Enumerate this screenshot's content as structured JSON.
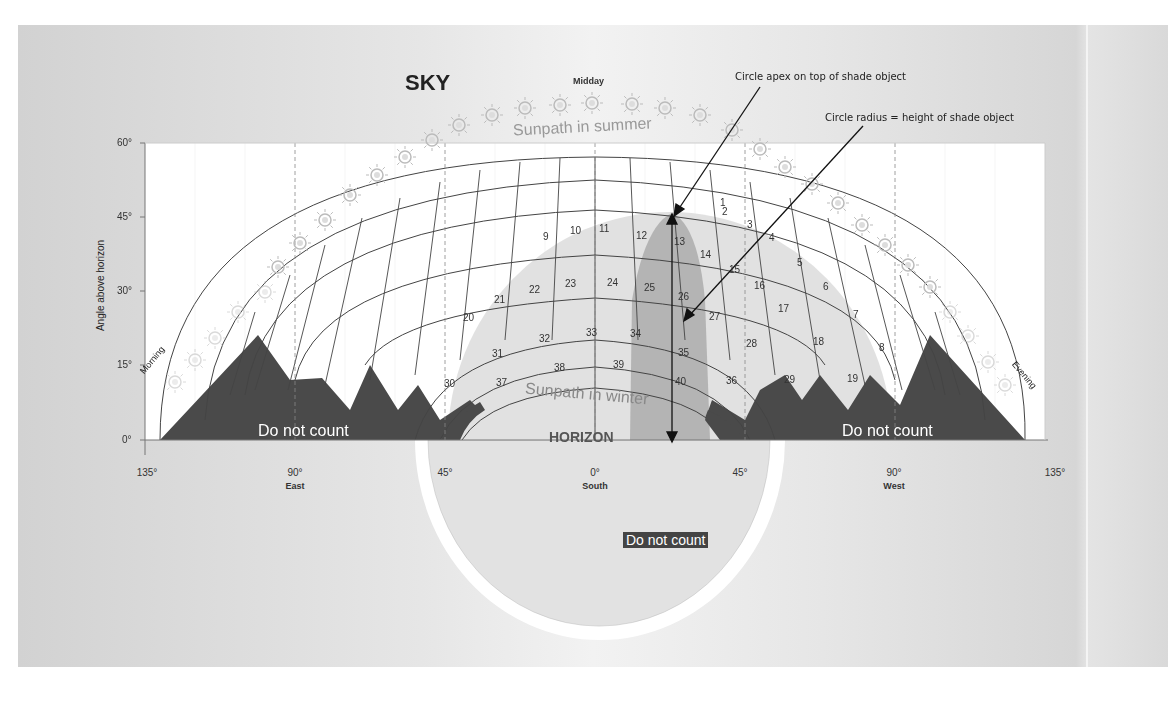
{
  "diagram": {
    "title": "SKY",
    "midday_label": "Midday",
    "annotations": {
      "apex": "Circle apex on top of shade object",
      "radius": "Circle radius = height of shade object"
    },
    "y_axis": {
      "label": "Angle above horizon",
      "ticks": [
        "60°",
        "45°",
        "30°",
        "15°",
        "0°"
      ]
    },
    "x_axis": {
      "ticks": [
        {
          "value": "135°",
          "sub": ""
        },
        {
          "value": "90°",
          "sub": "East"
        },
        {
          "value": "45°",
          "sub": ""
        },
        {
          "value": "0°",
          "sub": "South"
        },
        {
          "value": "45°",
          "sub": ""
        },
        {
          "value": "90°",
          "sub": "West"
        },
        {
          "value": "135°",
          "sub": ""
        }
      ]
    },
    "side_labels": {
      "morning": "Morning",
      "evening": "Evening"
    },
    "sunpath_summer": "Sunpath in summer",
    "sunpath_winter": "Sunpath in winter",
    "horizon_label": "HORIZON",
    "do_not_count_left": "Do not count",
    "do_not_count_right": "Do not count",
    "do_not_count_bottom": "Do not count",
    "cell_numbers": [
      "1",
      "2",
      "3",
      "4",
      "5",
      "6",
      "7",
      "8",
      "9",
      "10",
      "11",
      "12",
      "13",
      "14",
      "15",
      "16",
      "17",
      "18",
      "19",
      "20",
      "21",
      "22",
      "23",
      "24",
      "25",
      "26",
      "27",
      "28",
      "29",
      "30",
      "31",
      "32",
      "33",
      "34",
      "35",
      "36",
      "37",
      "38",
      "39",
      "40"
    ],
    "colors": {
      "shade_dark": "#4a4a4a",
      "shade_circle": "#d9d9d9",
      "shade_object": "#a8a8a8",
      "sun_icon": "#c8c8c8",
      "background": "#e4e4e4"
    }
  }
}
